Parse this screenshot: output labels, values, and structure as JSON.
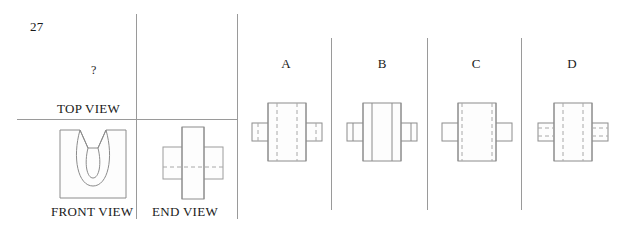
{
  "question": {
    "number": "27",
    "unknown_marker": "?"
  },
  "given_views": {
    "top_view_label": "TOP VIEW",
    "front_view_label": "FRONT VIEW",
    "end_view_label": "END VIEW",
    "missing_view": "TOP VIEW"
  },
  "options": [
    {
      "letter": "A",
      "name": "option-a"
    },
    {
      "letter": "B",
      "name": "option-b"
    },
    {
      "letter": "C",
      "name": "option-c"
    },
    {
      "letter": "D",
      "name": "option-d"
    }
  ],
  "drawing_data": {
    "type": "orthographic-projection-multiple-choice",
    "line_styles": {
      "visible_edge": "solid",
      "hidden_edge": "dashed",
      "center_line": "dash-dot"
    },
    "colors": {
      "line": "#8c8c8c",
      "hidden_line": "#a8a8a8",
      "center_line": "#b5b5b5",
      "rule": "#9a9a9a",
      "text": "#1a1a1a",
      "background": "#ffffff"
    },
    "front_view": {
      "description": "Rectangular block with a U-shaped semicircular groove opening at the top, flanked by chamfered upper corners",
      "outline": "rectangle",
      "feature": "u-groove-with-chamfers"
    },
    "end_view": {
      "description": "Cross / plus shape: tall vertical rectangle crossed by a wider horizontal rectangle, with a horizontal hidden line across the middle",
      "outline": "cross",
      "hidden_lines": 1
    },
    "answer_choices": {
      "A": {
        "outline": "cross",
        "center_block": "tall vertical rectangle",
        "side_wings": "two horizontal rectangles",
        "hidden_lines": "two full-height vertical dashed lines inside the central rectangle, plus short dashed segments in each wing"
      },
      "B": {
        "outline": "cross",
        "center_block": "tall vertical rectangle",
        "side_wings": "two horizontal rectangles",
        "hidden_lines": "none - two full-height vertical solid lines inside the central rectangle"
      },
      "C": {
        "outline": "cross",
        "center_block": "tall vertical rectangle",
        "side_wings": "two horizontal rectangles",
        "hidden_lines": "two full-height vertical dashed lines set close to the central rectangle edges"
      },
      "D": {
        "outline": "cross",
        "center_block": "tall vertical rectangle",
        "side_wings": "two horizontal rectangles",
        "hidden_lines": "two vertical dashed lines inside the central rectangle plus horizontal dashed lines running through both wings"
      }
    }
  }
}
